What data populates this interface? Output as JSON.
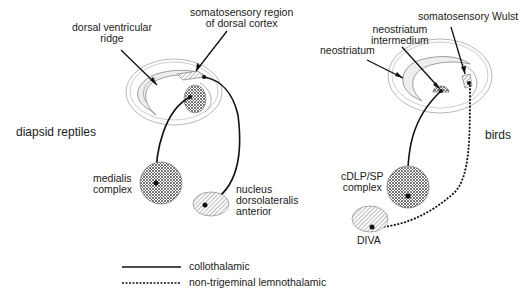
{
  "panels": {
    "left": {
      "group_label": "diapsid reptiles",
      "labels": {
        "dvr": [
          "dorsal ventricular",
          "ridge"
        ],
        "somato": [
          "somatosensory region",
          "of dorsal cortex"
        ],
        "medialis": [
          "medialis",
          "complex"
        ],
        "nda": [
          "nucleus",
          "dorsolateralis",
          "anterior"
        ]
      }
    },
    "right": {
      "group_label": "birds",
      "labels": {
        "neostriatum": "neostriatum",
        "ni": [
          "neostriatum",
          "intermedium"
        ],
        "wulst": "somatosensory Wulst",
        "cdlp": [
          "cDLP/SP",
          "complex"
        ],
        "diva": "DIVA"
      }
    }
  },
  "legend": {
    "items": [
      {
        "label": "collothalamic",
        "style": "solid"
      },
      {
        "label": "non-trigeminal lemnothalamic",
        "style": "dotted"
      }
    ]
  }
}
